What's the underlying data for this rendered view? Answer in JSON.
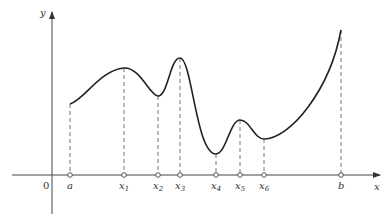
{
  "diagram": {
    "type": "function-graph",
    "axes": {
      "x_label": "x",
      "y_label": "y",
      "origin_label": "0",
      "color": "#333333"
    },
    "curve": {
      "color": "#222222",
      "description": "continuous function on [a, b] with local extrema at x1..x6"
    },
    "points": [
      {
        "id": "a",
        "label": "a",
        "sub": "",
        "px": 70,
        "py": 104
      },
      {
        "id": "x1",
        "label": "x",
        "sub": "1",
        "px": 124,
        "py": 68
      },
      {
        "id": "x2",
        "label": "x",
        "sub": "2",
        "px": 158,
        "py": 96
      },
      {
        "id": "x3",
        "label": "x",
        "sub": "3",
        "px": 180,
        "py": 58
      },
      {
        "id": "x4",
        "label": "x",
        "sub": "4",
        "px": 216,
        "py": 154
      },
      {
        "id": "x5",
        "label": "x",
        "sub": "5",
        "px": 240,
        "py": 120
      },
      {
        "id": "x6",
        "label": "x",
        "sub": "6",
        "px": 264,
        "py": 139
      },
      {
        "id": "b",
        "label": "b",
        "sub": "",
        "px": 341,
        "py": 30
      }
    ]
  }
}
